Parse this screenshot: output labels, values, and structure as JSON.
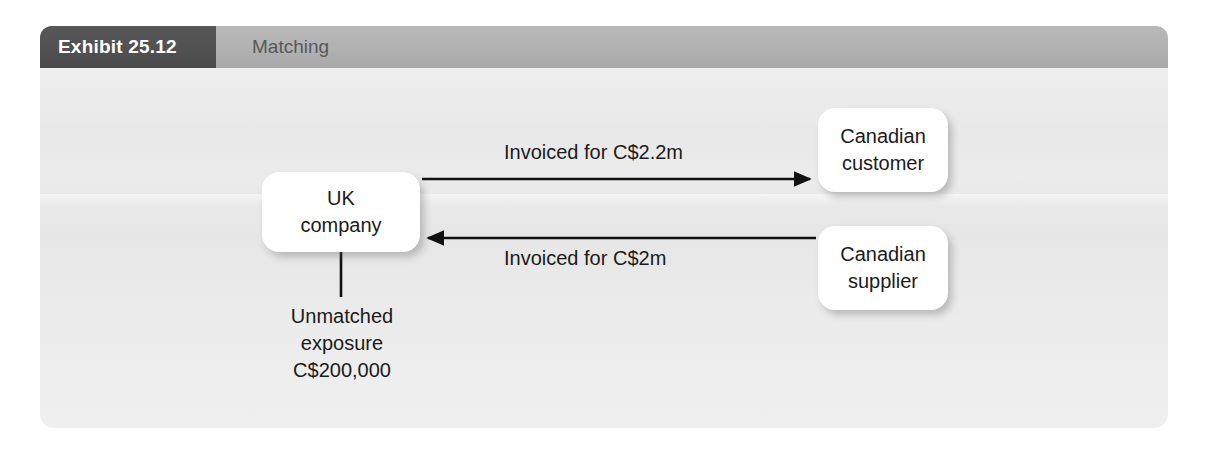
{
  "exhibit": {
    "tab_label": "Exhibit 25.12",
    "title": "Matching"
  },
  "colors": {
    "tab_background": "#515151",
    "header_background": "#b2b2b2",
    "panel_background": "#eaeaea",
    "node_background": "#ffffff",
    "text": "#1b1b1b",
    "connector": "#111111"
  },
  "diagram": {
    "type": "flow",
    "nodes": [
      {
        "id": "uk-company",
        "lines": [
          "UK",
          "company"
        ]
      },
      {
        "id": "canadian-customer",
        "lines": [
          "Canadian",
          "customer"
        ]
      },
      {
        "id": "canadian-supplier",
        "lines": [
          "Canadian",
          "supplier"
        ]
      }
    ],
    "edges": [
      {
        "id": "uk-to-customer",
        "label": "Invoiced for C$2.2m",
        "from": "uk-company",
        "to": "canadian-customer",
        "direction": "right"
      },
      {
        "id": "supplier-to-uk",
        "label": "Invoiced for C$2m",
        "from": "canadian-supplier",
        "to": "uk-company",
        "direction": "left"
      }
    ],
    "annotation": {
      "id": "unmatched-exposure",
      "lines": [
        "Unmatched",
        "exposure",
        "C$200,000"
      ]
    }
  }
}
